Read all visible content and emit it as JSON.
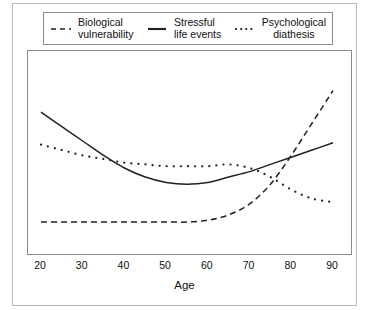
{
  "figure": {
    "border_color": "#b9b9b9",
    "background": "#ffffff"
  },
  "legend": {
    "position": "top-inside",
    "entries": [
      {
        "sample": "dashed-line-sample",
        "line1": "Biological",
        "line2": "vulnerability",
        "style": "dashed"
      },
      {
        "sample": "solid-line-sample",
        "line1": "Stressful",
        "line2": "life events",
        "style": "solid"
      },
      {
        "sample": "dotted-line-sample",
        "line1": "Psychological",
        "line2": "diathesis",
        "style": "dotted"
      }
    ]
  },
  "axis": {
    "xlabel": "Age",
    "xticks": [
      "20",
      "30",
      "40",
      "50",
      "60",
      "70",
      "80",
      "90"
    ]
  },
  "chart_data": {
    "type": "line",
    "title": "",
    "subtitle": "",
    "xlabel": "Age",
    "ylabel": "",
    "xlim": [
      20,
      90
    ],
    "ylim": [
      0,
      100
    ],
    "grid": false,
    "legend_position": "top",
    "xticks": [
      20,
      30,
      40,
      50,
      60,
      70,
      80,
      90
    ],
    "yticks": [],
    "x": [
      20,
      25,
      30,
      35,
      40,
      45,
      50,
      55,
      60,
      65,
      70,
      75,
      80,
      85,
      90
    ],
    "series": [
      {
        "name": "Biological vulnerability",
        "style": "dashed",
        "color": "#222222",
        "values": [
          15,
          15,
          15,
          15,
          15,
          15,
          15,
          15,
          16,
          19,
          25,
          36,
          52,
          70,
          88
        ]
      },
      {
        "name": "Stressful life events",
        "style": "solid",
        "color": "#222222",
        "values": [
          76,
          68,
          60,
          52,
          45,
          40,
          37,
          36,
          37,
          40,
          43,
          47,
          51,
          55,
          59
        ]
      },
      {
        "name": "Psychological diathesis",
        "style": "dotted",
        "color": "#222222",
        "values": [
          58,
          55,
          52,
          50,
          48,
          47,
          46,
          46,
          46,
          47,
          45,
          40,
          33,
          28,
          26
        ]
      }
    ],
    "annotations": []
  }
}
